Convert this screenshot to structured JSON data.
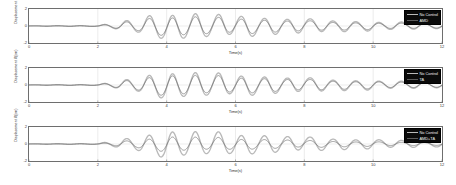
{
  "figure": {
    "type": "matlab-multi-subplot-timeseries",
    "background": "#ffffff",
    "panel_count": 3
  },
  "axes": {
    "xlabel": "Time(s)",
    "ylabel": "Displacement X(cm)",
    "xticks": [
      "0",
      "2",
      "4",
      "6",
      "8",
      "10",
      "12"
    ],
    "yticks": [
      "2",
      "0",
      "-2"
    ],
    "xlim": [
      0,
      12
    ],
    "ylim": [
      -2,
      2
    ],
    "grid": true,
    "axis_color": "#6e6e6e",
    "tick_color": "#3a3a3a"
  },
  "colors": {
    "no_control": "#b9b9b9",
    "controlled": "#5a5a5a",
    "legend_background": "#0a0a0a",
    "legend_text": "#f2f2f2",
    "grid": "#d8d8d8"
  },
  "panels": [
    {
      "id": "panel-amd",
      "legend": [
        {
          "label": "No Control",
          "color": "#b9b9b9",
          "width": 1.5
        },
        {
          "label": "AMD",
          "color": "#5a5a5a",
          "width": 0.8
        }
      ]
    },
    {
      "id": "panel-ta",
      "legend": [
        {
          "label": "No Control",
          "color": "#b9b9b9",
          "width": 1.5
        },
        {
          "label": "TA",
          "color": "#5a5a5a",
          "width": 0.8
        }
      ]
    },
    {
      "id": "panel-amd-ta",
      "legend": [
        {
          "label": "No Control",
          "color": "#b9b9b9",
          "width": 1.5
        },
        {
          "label": "AMD+TA",
          "color": "#5a5a5a",
          "width": 0.8
        }
      ]
    }
  ],
  "chart_data": {
    "type": "line",
    "title": "",
    "xlabel": "Time(s)",
    "ylabel": "Displacement X(cm)",
    "xlim": [
      0,
      12
    ],
    "ylim": [
      -2,
      2
    ],
    "xticks": [
      0,
      2,
      4,
      6,
      8,
      10,
      12
    ],
    "yticks": [
      -2,
      0,
      2
    ],
    "grid": true,
    "legend_position": "top-right",
    "subplots": [
      {
        "name": "AMD",
        "series": [
          {
            "name": "No Control",
            "color": "#b9b9b9",
            "envelope_t": [
              0,
              2.0,
              2.6,
              3.2,
              3.8,
              4.4,
              5.0,
              5.6,
              6.2,
              6.8,
              7.4,
              8.0,
              8.6,
              9.2,
              9.8,
              10.4,
              11.0,
              11.6,
              12.0
            ],
            "envelope_amp": [
              0.02,
              0.05,
              0.42,
              0.85,
              1.35,
              1.45,
              1.32,
              1.2,
              1.12,
              1.0,
              0.88,
              0.78,
              0.68,
              0.6,
              0.52,
              0.45,
              0.4,
              0.34,
              0.3
            ],
            "frequency_hz": 1.5,
            "phase": 0
          },
          {
            "name": "AMD",
            "color": "#5a5a5a",
            "envelope_t": [
              0,
              2.0,
              2.6,
              3.2,
              3.8,
              4.4,
              5.0,
              5.6,
              6.2,
              6.8,
              7.4,
              8.0,
              8.6,
              9.2,
              9.8,
              10.4,
              11.0,
              11.6,
              12.0
            ],
            "envelope_amp": [
              0.015,
              0.04,
              0.32,
              0.64,
              1.0,
              1.08,
              0.98,
              0.88,
              0.82,
              0.73,
              0.64,
              0.56,
              0.49,
              0.43,
              0.37,
              0.32,
              0.28,
              0.24,
              0.21
            ],
            "frequency_hz": 1.5,
            "phase": 0
          }
        ]
      },
      {
        "name": "TA",
        "series": [
          {
            "name": "No Control",
            "color": "#b9b9b9",
            "envelope_t": [
              0,
              2.0,
              2.6,
              3.2,
              3.8,
              4.4,
              5.0,
              5.6,
              6.2,
              6.8,
              7.4,
              8.0,
              8.6,
              9.2,
              9.8,
              10.4,
              11.0,
              11.6,
              12.0
            ],
            "envelope_amp": [
              0.02,
              0.05,
              0.42,
              0.85,
              1.35,
              1.45,
              1.32,
              1.2,
              1.12,
              1.0,
              0.88,
              0.78,
              0.68,
              0.6,
              0.52,
              0.45,
              0.4,
              0.34,
              0.3
            ],
            "frequency_hz": 1.5,
            "phase": 0
          },
          {
            "name": "TA",
            "color": "#5a5a5a",
            "envelope_t": [
              0,
              2.0,
              2.6,
              3.2,
              3.8,
              4.4,
              5.0,
              5.6,
              6.2,
              6.8,
              7.4,
              8.0,
              8.6,
              9.2,
              9.8,
              10.4,
              11.0,
              11.6,
              12.0
            ],
            "envelope_amp": [
              0.015,
              0.04,
              0.34,
              0.68,
              1.06,
              1.14,
              1.03,
              0.93,
              0.87,
              0.77,
              0.68,
              0.6,
              0.52,
              0.46,
              0.4,
              0.34,
              0.3,
              0.26,
              0.23
            ],
            "frequency_hz": 1.5,
            "phase": 0
          }
        ]
      },
      {
        "name": "AMD+TA",
        "series": [
          {
            "name": "No Control",
            "color": "#b9b9b9",
            "envelope_t": [
              0,
              2.0,
              2.6,
              3.2,
              3.8,
              4.4,
              5.0,
              5.6,
              6.2,
              6.8,
              7.4,
              8.0,
              8.6,
              9.2,
              9.8,
              10.4,
              11.0,
              11.6,
              12.0
            ],
            "envelope_amp": [
              0.02,
              0.05,
              0.42,
              0.85,
              1.35,
              1.45,
              1.32,
              1.2,
              1.12,
              1.0,
              0.88,
              0.78,
              0.68,
              0.6,
              0.52,
              0.45,
              0.4,
              0.34,
              0.3
            ],
            "frequency_hz": 1.5,
            "phase": 0
          },
          {
            "name": "AMD+TA",
            "color": "#5a5a5a",
            "envelope_t": [
              0,
              2.0,
              2.6,
              3.2,
              3.8,
              4.4,
              5.0,
              5.6,
              6.2,
              6.8,
              7.4,
              8.0,
              8.6,
              9.2,
              9.8,
              10.4,
              11.0,
              11.6,
              12.0
            ],
            "envelope_amp": [
              0.012,
              0.03,
              0.24,
              0.48,
              0.76,
              0.82,
              0.73,
              0.65,
              0.6,
              0.53,
              0.46,
              0.4,
              0.35,
              0.3,
              0.26,
              0.22,
              0.19,
              0.16,
              0.14
            ],
            "frequency_hz": 1.5,
            "phase": 0
          }
        ]
      }
    ]
  }
}
